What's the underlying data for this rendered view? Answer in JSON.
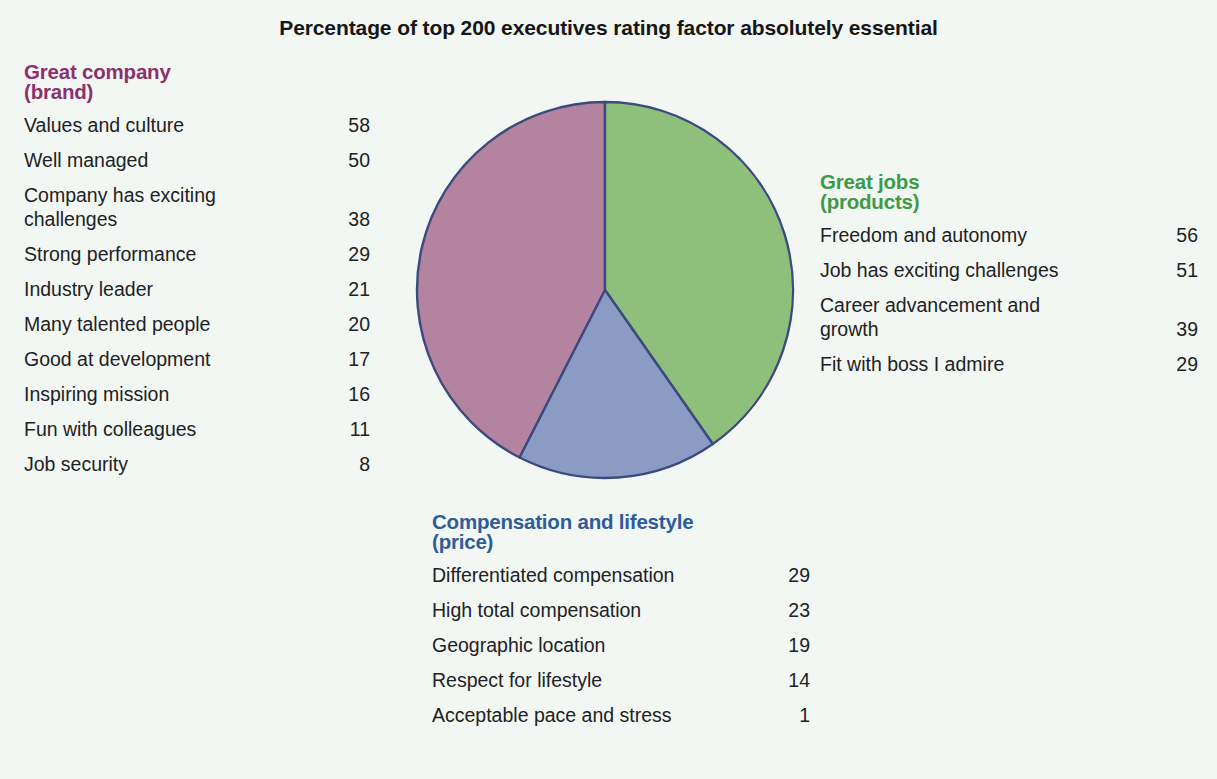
{
  "chart_data": {
    "type": "pie",
    "title": "Percentage of top 200 executives rating factor absolutely essential",
    "xlabel": "",
    "ylabel": "",
    "legend_position": "none",
    "grid": false,
    "categories": [
      "Great company (brand)",
      "Great jobs (products)",
      "Compensation and lifestyle (price)"
    ],
    "values": [
      42.5,
      40.3,
      17.2
    ],
    "colors": [
      "#b4839f",
      "#8ec07c",
      "#8b9cc4"
    ],
    "slice_start_angles_deg": [
      207,
      0,
      145
    ],
    "slice_end_angles_deg": [
      360,
      145,
      207
    ],
    "groups": [
      {
        "name": "Great company",
        "subtitle": "(brand)",
        "color": "#8d2f6e",
        "slice_color": "#b4839f",
        "factors": [
          {
            "label": "Values and culture",
            "value": 58
          },
          {
            "label": "Well managed",
            "value": 50
          },
          {
            "label": "Company has exciting\nchallenges",
            "value": 38
          },
          {
            "label": "Strong performance",
            "value": 29
          },
          {
            "label": "Industry leader",
            "value": 21
          },
          {
            "label": "Many talented people",
            "value": 20
          },
          {
            "label": "Good at development",
            "value": 17
          },
          {
            "label": "Inspiring mission",
            "value": 16
          },
          {
            "label": "Fun with colleagues",
            "value": 11
          },
          {
            "label": "Job security",
            "value": 8
          }
        ]
      },
      {
        "name": "Great jobs",
        "subtitle": "(products)",
        "color": "#3d9a46",
        "slice_color": "#8ec07c",
        "factors": [
          {
            "label": "Freedom and autonomy",
            "value": 56
          },
          {
            "label": "Job has exciting challenges",
            "value": 51
          },
          {
            "label": "Career advancement and\ngrowth",
            "value": 39
          },
          {
            "label": "Fit with boss I admire",
            "value": 29
          }
        ]
      },
      {
        "name": "Compensation and lifestyle",
        "subtitle": "(price)",
        "color": "#2e5c9a",
        "slice_color": "#8b9cc4",
        "factors": [
          {
            "label": "Differentiated compensation",
            "value": 29
          },
          {
            "label": "High total compensation",
            "value": 23
          },
          {
            "label": "Geographic location",
            "value": 19
          },
          {
            "label": "Respect for lifestyle",
            "value": 14
          },
          {
            "label": "Acceptable pace and stress",
            "value": 1
          }
        ]
      }
    ]
  },
  "title": "Percentage of top 200 executives rating factor absolutely essential",
  "panels": {
    "brand": {
      "heading": "Great company",
      "subheading": "(brand)",
      "rows": [
        {
          "label": "Values and culture",
          "value": "58"
        },
        {
          "label": "Well managed",
          "value": "50"
        },
        {
          "label": "Company has exciting\nchallenges",
          "value": "38"
        },
        {
          "label": "Strong performance",
          "value": "29"
        },
        {
          "label": "Industry leader",
          "value": "21"
        },
        {
          "label": "Many talented people",
          "value": "20"
        },
        {
          "label": "Good at development",
          "value": "17"
        },
        {
          "label": "Inspiring mission",
          "value": "16"
        },
        {
          "label": "Fun with colleagues",
          "value": "11"
        },
        {
          "label": "Job security",
          "value": "8"
        }
      ]
    },
    "jobs": {
      "heading": "Great jobs",
      "subheading": "(products)",
      "rows": [
        {
          "label": "Freedom and autonomy",
          "value": "56"
        },
        {
          "label": "Job has exciting challenges",
          "value": "51"
        },
        {
          "label": "Career advancement and\ngrowth",
          "value": "39"
        },
        {
          "label": "Fit with boss I admire",
          "value": "29"
        }
      ]
    },
    "compensation": {
      "heading": "Compensation and lifestyle",
      "subheading": "(price)",
      "rows": [
        {
          "label": "Differentiated compensation",
          "value": "29"
        },
        {
          "label": "High total compensation",
          "value": "23"
        },
        {
          "label": "Geographic location",
          "value": "19"
        },
        {
          "label": "Respect for lifestyle",
          "value": "14"
        },
        {
          "label": "Acceptable pace and stress",
          "value": "1"
        }
      ]
    }
  }
}
